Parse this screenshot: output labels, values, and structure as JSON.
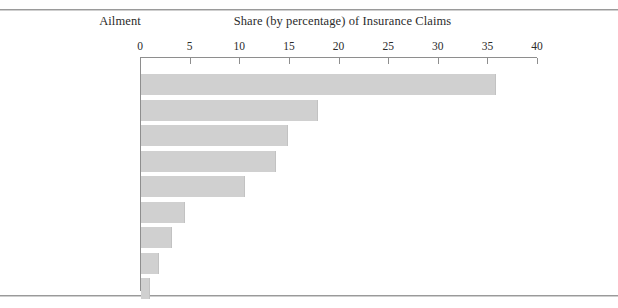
{
  "header": {
    "category_column_title": "Ailment",
    "value_column_title": "Share (by percentage) of Insurance Claims"
  },
  "chart_data": {
    "type": "bar",
    "orientation": "horizontal",
    "title": "Share (by percentage) of Insurance Claims",
    "xlabel": "Share (by percentage) of Insurance Claims",
    "ylabel": "Ailment",
    "xlim": [
      0,
      40
    ],
    "grid": false,
    "legend": null,
    "bar_color": "#d0d0d0",
    "axis_color": "#8e8e8e",
    "tick_labels": [
      "0",
      "5",
      "10",
      "15",
      "20",
      "25",
      "30",
      "35",
      "40"
    ],
    "ticks": [
      0,
      5,
      10,
      15,
      20,
      25,
      30,
      35,
      40
    ],
    "categories": [
      "Dementia,\nAlzheimer's",
      "Bone, joint\ndiseases",
      "Cancer",
      "Stroke",
      "Heart, blood\nconditions",
      "Organ disorders\n(stomach, liver)",
      "Lung disorders",
      "Wounds, injuries",
      "Diabetes"
    ],
    "values": [
      35.8,
      17.8,
      14.8,
      13.6,
      10.5,
      4.4,
      3.1,
      1.8,
      0.9
    ]
  }
}
